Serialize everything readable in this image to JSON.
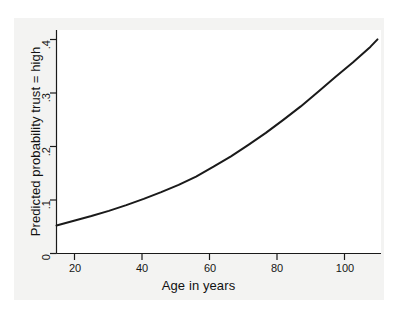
{
  "chart_data": {
    "type": "line",
    "title": "",
    "subtitle": "",
    "xlabel": "Age in years",
    "ylabel": "Predicted probability trust = high",
    "xlim": [
      15,
      108
    ],
    "ylim": [
      0,
      0.43
    ],
    "xticks": [
      20,
      40,
      60,
      80,
      100
    ],
    "xtick_labels": [
      "20",
      "40",
      "60",
      "80",
      "100"
    ],
    "yticks": [
      0,
      0.1,
      0.2,
      0.3,
      0.4
    ],
    "ytick_labels": [
      "0",
      ".1",
      ".2",
      ".3",
      ".4"
    ],
    "grid": false,
    "legend": null,
    "line_color": "#1a1a1a",
    "line_width": 2.0,
    "plot_background": "#ffffff",
    "figure_background": "#f3f3f2",
    "series": [
      {
        "name": "Predicted probability trust = high",
        "x": [
          15,
          20,
          25,
          30,
          35,
          40,
          45,
          50,
          55,
          60,
          65,
          70,
          75,
          80,
          85,
          90,
          95,
          100,
          105,
          107
        ],
        "values": [
          0.054,
          0.063,
          0.072,
          0.082,
          0.093,
          0.105,
          0.118,
          0.132,
          0.148,
          0.167,
          0.187,
          0.209,
          0.232,
          0.257,
          0.283,
          0.311,
          0.34,
          0.368,
          0.398,
          0.412
        ]
      }
    ]
  },
  "axis": {
    "x_title": "Age in years",
    "y_title": "Predicted probability trust = high",
    "x_tick_0": "20",
    "x_tick_1": "40",
    "x_tick_2": "60",
    "x_tick_3": "80",
    "x_tick_4": "100",
    "y_tick_0": "0",
    "y_tick_1": ".1",
    "y_tick_2": ".2",
    "y_tick_3": ".3",
    "y_tick_4": ".4"
  }
}
